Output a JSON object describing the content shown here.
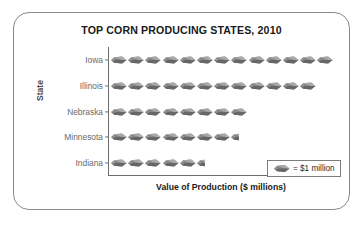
{
  "chart": {
    "title": "TOP CORN PRODUCING STATES, 2010",
    "x_axis_title": "Value of Production ($ millions)",
    "y_axis_title": "State",
    "legend_text": "= $1 million",
    "legend_icon_name": "corn-ear-icon"
  },
  "chart_data": {
    "type": "bar",
    "subtype": "pictograph",
    "title": "TOP CORN PRODUCING STATES, 2010",
    "xlabel": "Value of Production ($ millions)",
    "ylabel": "State",
    "orientation": "horizontal",
    "unit_symbol": "corn ear",
    "unit_value": 1,
    "unit_label": "= $1 million",
    "grid": false,
    "legend_position": "inside-bottom-right",
    "categories": [
      "Iowa",
      "Illinois",
      "Nebraska",
      "Minnesota",
      "Indiana"
    ],
    "values": [
      13,
      12,
      8,
      7.5,
      5.5
    ],
    "icon_counts": [
      13,
      12,
      8,
      7.5,
      5.5
    ],
    "axis_tick_labels": [],
    "rows": [
      {
        "label": "Iowa",
        "icons": 13,
        "value": 13
      },
      {
        "label": "Illinois",
        "icons": 12,
        "value": 12
      },
      {
        "label": "Nebraska",
        "icons": 8,
        "value": 8
      },
      {
        "label": "Minnesota",
        "icons": 7.5,
        "value": 7.5
      },
      {
        "label": "Indiana",
        "icons": 5.5,
        "value": 5.5
      }
    ]
  },
  "colors": {
    "card_border": "#8a8a8a",
    "axis": "#6d6d6d",
    "icon_dark": "#595959",
    "icon_light": "#c9c9c9",
    "label_text": "#6a6a6a",
    "title_text": "#1a1a1a"
  }
}
